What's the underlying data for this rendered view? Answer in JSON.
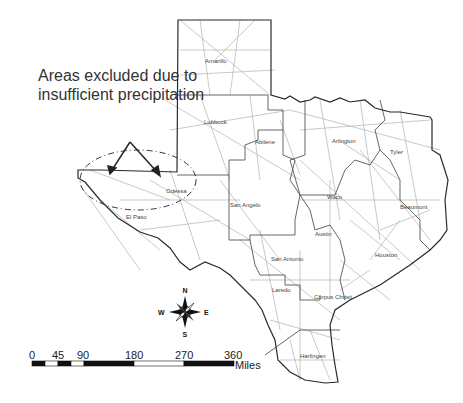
{
  "annotation": {
    "line1": "Areas excluded due to",
    "line2": "insufficient precipitation"
  },
  "cities": [
    {
      "name": "Amarillo",
      "x": 218,
      "y": 61
    },
    {
      "name": "Lubbock",
      "x": 214,
      "y": 122
    },
    {
      "name": "Abilene",
      "x": 265,
      "y": 142
    },
    {
      "name": "Arlington",
      "x": 344,
      "y": 141
    },
    {
      "name": "Tyler",
      "x": 397,
      "y": 152
    },
    {
      "name": "Odessa",
      "x": 168,
      "y": 191
    },
    {
      "name": "El Paso",
      "x": 126,
      "y": 217
    },
    {
      "name": "San Angelo",
      "x": 231,
      "y": 205
    },
    {
      "name": "Waco",
      "x": 334,
      "y": 197
    },
    {
      "name": "Beaumont",
      "x": 404,
      "y": 207
    },
    {
      "name": "Austin",
      "x": 321,
      "y": 234
    },
    {
      "name": "Houston",
      "x": 385,
      "y": 255
    },
    {
      "name": "San Antonio",
      "x": 273,
      "y": 259
    },
    {
      "name": "Laredo",
      "x": 273,
      "y": 290
    },
    {
      "name": "Corpus Christi",
      "x": 314,
      "y": 297
    },
    {
      "name": "Harlingen",
      "x": 301,
      "y": 356
    }
  ],
  "compass": {
    "n": "N",
    "s": "S",
    "e": "E",
    "w": "W"
  },
  "scale_bar": {
    "ticks": [
      "0",
      "45",
      "90",
      "180",
      "270",
      "360"
    ],
    "unit": "Miles"
  },
  "colors": {
    "roads": "#9a9a9a",
    "borders": "#333333",
    "region_borders": "#555555",
    "text": "#333333"
  }
}
